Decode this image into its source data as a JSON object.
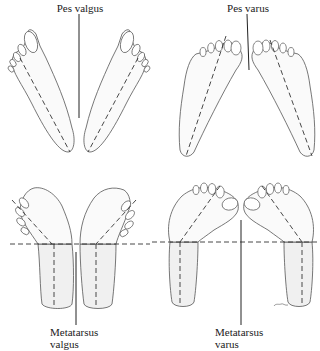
{
  "figure": {
    "panels": [
      {
        "id": "pes-valgus",
        "label": "Pes valgus",
        "position": "top-left"
      },
      {
        "id": "pes-varus",
        "label": "Pes varus",
        "position": "top-right"
      },
      {
        "id": "metatarsus-valgus",
        "label_line1": "Metatarsus",
        "label_line2": "valgus",
        "position": "bottom-left"
      },
      {
        "id": "metatarsus-varus",
        "label_line1": "Metatarsus",
        "label_line2": "varus",
        "position": "bottom-right"
      }
    ],
    "artist_signature": "~"
  }
}
